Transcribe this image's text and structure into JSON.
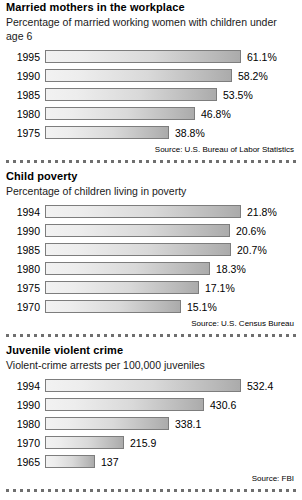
{
  "chart_data": [
    {
      "type": "bar",
      "orientation": "horizontal",
      "title": "Married mothers in the workplace",
      "subtitle": "Percentage of married working women with children under age 6",
      "source": "Source: U.S. Bureau of Labor Statistics",
      "categories": [
        "1995",
        "1990",
        "1985",
        "1980",
        "1975"
      ],
      "values": [
        61.1,
        58.2,
        53.5,
        46.8,
        38.8
      ],
      "labels": [
        "61.1%",
        "58.2%",
        "53.5%",
        "46.8%",
        "38.8%"
      ],
      "xlabel": "",
      "ylabel": "",
      "xlim": [
        0,
        61.1
      ],
      "grid": false,
      "legend": "none"
    },
    {
      "type": "bar",
      "orientation": "horizontal",
      "title": "Child poverty",
      "subtitle": "Percentage of children living in poverty",
      "source": "Source: U.S. Census Bureau",
      "categories": [
        "1994",
        "1990",
        "1985",
        "1980",
        "1975",
        "1970"
      ],
      "values": [
        21.8,
        20.6,
        20.7,
        18.3,
        17.1,
        15.1
      ],
      "labels": [
        "21.8%",
        "20.6%",
        "20.7%",
        "18.3%",
        "17.1%",
        "15.1%"
      ],
      "xlabel": "",
      "ylabel": "",
      "xlim": [
        0,
        21.8
      ],
      "grid": false,
      "legend": "none"
    },
    {
      "type": "bar",
      "orientation": "horizontal",
      "title": "Juvenile violent crime",
      "subtitle": "Violent-crime arrests per 100,000 juveniles",
      "source": "Source: FBI",
      "categories": [
        "1994",
        "1990",
        "1980",
        "1970",
        "1965"
      ],
      "values": [
        532.4,
        430.6,
        338.1,
        215.9,
        137
      ],
      "labels": [
        "532.4",
        "430.6",
        "338.1",
        "215.9",
        "137"
      ],
      "xlabel": "",
      "ylabel": "",
      "xlim": [
        0,
        532.4
      ],
      "grid": false,
      "legend": "none"
    }
  ],
  "colors": {
    "bar_border": "#7d7d7d",
    "bar_fill_light": "#f2f2f2",
    "bar_fill_dark": "#ababab",
    "text": "#000000",
    "divider": "#6f6f6f",
    "background": "#ffffff"
  }
}
